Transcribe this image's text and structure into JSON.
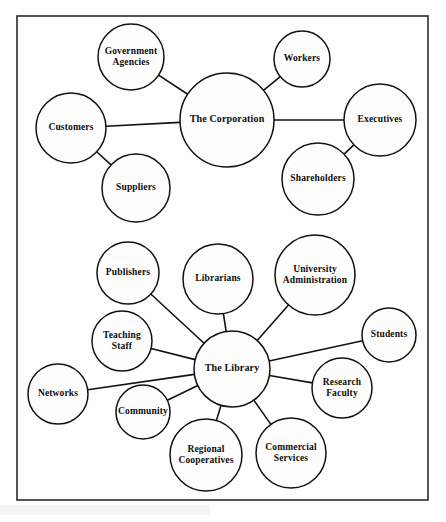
{
  "figure": {
    "background_color": "#fdfdfd",
    "border_color": "#2a2a2a",
    "line_color": "#121212",
    "text_color": "#0d0d0d",
    "border": {
      "x": 17,
      "y": 16,
      "width": 411,
      "height": 484
    }
  },
  "chart_data": {
    "type": "diagram",
    "subtype": "node-link-network",
    "title": "",
    "diagrams": [
      {
        "id": "corporation-network",
        "hub": "The  Corporation",
        "nodes": [
          "The  Corporation",
          "Government Agencies",
          "Workers",
          "Executives",
          "Shareholders",
          "Suppliers",
          "Customers"
        ],
        "edges": [
          [
            "Customers",
            "The  Corporation"
          ],
          [
            "Government Agencies",
            "The  Corporation"
          ],
          [
            "Workers",
            "The  Corporation"
          ],
          [
            "The  Corporation",
            "Executives"
          ],
          [
            "Shareholders",
            "Executives"
          ],
          [
            "Customers",
            "Suppliers"
          ]
        ]
      },
      {
        "id": "library-network",
        "hub": "The Library",
        "nodes": [
          "The Library",
          "Publishers",
          "Librarians",
          "University Administration",
          "Students",
          "Research Faculty",
          "Commercial Services",
          "Regional Cooperatives",
          "Community",
          "Networks",
          "Teaching Staff"
        ],
        "edges": [
          [
            "Publishers",
            "The Library"
          ],
          [
            "Librarians",
            "The Library"
          ],
          [
            "University Administration",
            "The Library"
          ],
          [
            "Students",
            "The Library"
          ],
          [
            "Research Faculty",
            "The Library"
          ],
          [
            "Commercial Services",
            "The Library"
          ],
          [
            "Regional Cooperatives",
            "The Library"
          ],
          [
            "Community",
            "The Library"
          ],
          [
            "Networks",
            "The Library"
          ],
          [
            "Teaching Staff",
            "The Library"
          ]
        ]
      }
    ]
  },
  "nodes": [
    {
      "id": "government-agencies",
      "lines": [
        "Government",
        "Agencies"
      ],
      "cx": 131,
      "cy": 57,
      "r": 33,
      "hub": false
    },
    {
      "id": "workers",
      "lines": [
        "Workers"
      ],
      "cx": 302,
      "cy": 59,
      "r": 28,
      "hub": false
    },
    {
      "id": "customers",
      "lines": [
        "Customers"
      ],
      "cx": 71,
      "cy": 128,
      "r": 35,
      "hub": false
    },
    {
      "id": "the-corporation",
      "lines": [
        "The  Corporation"
      ],
      "cx": 227,
      "cy": 120,
      "r": 47,
      "hub": true
    },
    {
      "id": "executives",
      "lines": [
        "Executives"
      ],
      "cx": 380,
      "cy": 120,
      "r": 36,
      "hub": false
    },
    {
      "id": "suppliers",
      "lines": [
        "Suppliers"
      ],
      "cx": 136,
      "cy": 188,
      "r": 34,
      "hub": false
    },
    {
      "id": "shareholders",
      "lines": [
        "Shareholders"
      ],
      "cx": 318,
      "cy": 179,
      "r": 36,
      "hub": false
    },
    {
      "id": "publishers",
      "lines": [
        "Publishers"
      ],
      "cx": 128,
      "cy": 273,
      "r": 31,
      "hub": false
    },
    {
      "id": "librarians",
      "lines": [
        "Librarians"
      ],
      "cx": 218,
      "cy": 279,
      "r": 35,
      "hub": false
    },
    {
      "id": "university-administration",
      "lines": [
        "University",
        "Administration"
      ],
      "cx": 315,
      "cy": 275,
      "r": 40,
      "hub": false
    },
    {
      "id": "teaching-staff",
      "lines": [
        "Teaching",
        "Staff"
      ],
      "cx": 122,
      "cy": 341,
      "r": 30,
      "hub": false
    },
    {
      "id": "students",
      "lines": [
        "Students"
      ],
      "cx": 389,
      "cy": 335,
      "r": 27,
      "hub": false
    },
    {
      "id": "the-library",
      "lines": [
        "The Library"
      ],
      "cx": 232,
      "cy": 369,
      "r": 38,
      "hub": true
    },
    {
      "id": "networks",
      "lines": [
        "Networks"
      ],
      "cx": 58,
      "cy": 394,
      "r": 30,
      "hub": false
    },
    {
      "id": "research-faculty",
      "lines": [
        "Research",
        "Faculty"
      ],
      "cx": 342,
      "cy": 388,
      "r": 30,
      "hub": false
    },
    {
      "id": "community",
      "lines": [
        "Community"
      ],
      "cx": 143,
      "cy": 412,
      "r": 27,
      "hub": false
    },
    {
      "id": "regional-cooperatives",
      "lines": [
        "Regional",
        "Cooperatives"
      ],
      "cx": 206,
      "cy": 455,
      "r": 36,
      "hub": false
    },
    {
      "id": "commercial-services",
      "lines": [
        "Commercial",
        "Services"
      ],
      "cx": 291,
      "cy": 453,
      "r": 35,
      "hub": false
    }
  ],
  "edges": [
    {
      "id": "edge-customers-corporation",
      "from": "customers",
      "to": "the-corporation"
    },
    {
      "id": "edge-government-corporation",
      "from": "government-agencies",
      "to": "the-corporation"
    },
    {
      "id": "edge-workers-corporation",
      "from": "workers",
      "to": "the-corporation"
    },
    {
      "id": "edge-corporation-executives",
      "from": "the-corporation",
      "to": "executives"
    },
    {
      "id": "edge-shareholders-executives",
      "from": "shareholders",
      "to": "executives"
    },
    {
      "id": "edge-customers-suppliers",
      "from": "customers",
      "to": "suppliers"
    },
    {
      "id": "edge-publishers-library",
      "from": "publishers",
      "to": "the-library"
    },
    {
      "id": "edge-librarians-library",
      "from": "librarians",
      "to": "the-library"
    },
    {
      "id": "edge-university-library",
      "from": "university-administration",
      "to": "the-library"
    },
    {
      "id": "edge-students-library",
      "from": "students",
      "to": "the-library"
    },
    {
      "id": "edge-research-faculty-library",
      "from": "research-faculty",
      "to": "the-library"
    },
    {
      "id": "edge-commercial-services-library",
      "from": "commercial-services",
      "to": "the-library"
    },
    {
      "id": "edge-regional-cooperatives-library",
      "from": "regional-cooperatives",
      "to": "the-library"
    },
    {
      "id": "edge-community-library",
      "from": "community",
      "to": "the-library"
    },
    {
      "id": "edge-networks-library",
      "from": "networks",
      "to": "the-library"
    },
    {
      "id": "edge-teaching-staff-library",
      "from": "teaching-staff",
      "to": "the-library"
    }
  ]
}
